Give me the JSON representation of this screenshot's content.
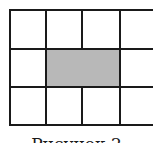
{
  "figure": {
    "caption": "Рисунок 2",
    "grid": {
      "rows": 3,
      "cols": 4,
      "shaded_cells": [
        [
          1,
          1
        ],
        [
          1,
          2
        ]
      ],
      "shade_color": "#b8b8b8",
      "line_color": "#1a1a1a"
    }
  }
}
